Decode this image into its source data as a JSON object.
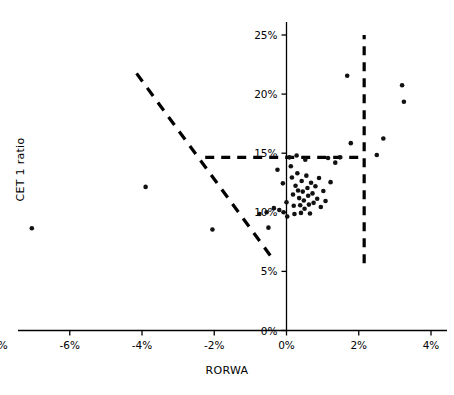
{
  "chart_data": {
    "type": "scatter",
    "title": "",
    "xlabel": "RORWA",
    "ylabel": "CET 1 ratio",
    "xlim": [
      -0.09,
      0.045
    ],
    "ylim": [
      0.0,
      0.26
    ],
    "xticks": [
      "-8%",
      "-6%",
      "-4%",
      "-2%",
      "0%",
      "2%",
      "4%"
    ],
    "xtick_values": [
      -0.08,
      -0.06,
      -0.04,
      -0.02,
      0.0,
      0.02,
      0.04
    ],
    "yticks": [
      "0%",
      "5%",
      "10%",
      "15%",
      "20%",
      "25%"
    ],
    "ytick_values": [
      0.0,
      0.05,
      0.1,
      0.15,
      0.2,
      0.25
    ],
    "grid": false,
    "legend": "none",
    "point_color": "#111111",
    "point_size": 4,
    "annotations": [
      {
        "name": "vertical-threshold-line",
        "type": "dashed-line",
        "orientation": "vertical",
        "x": 0.0215,
        "y_from": 0.057,
        "y_to": 0.25,
        "color": "#000000"
      },
      {
        "name": "horizontal-threshold-line",
        "type": "dashed-line",
        "orientation": "horizontal",
        "y": 0.1465,
        "x_from": -0.0225,
        "x_to": 0.0215,
        "color": "#000000"
      },
      {
        "name": "diagonal-frontier-line",
        "type": "dashed-line",
        "orientation": "diagonal",
        "x_from": -0.0415,
        "y_from": 0.2175,
        "x_to": -0.0045,
        "y_to": 0.0635,
        "color": "#000000"
      }
    ],
    "points": [
      {
        "x": -0.0705,
        "y": 0.0865
      },
      {
        "x": -0.039,
        "y": 0.1215
      },
      {
        "x": -0.0205,
        "y": 0.0855
      },
      {
        "x": -0.0075,
        "y": 0.0985
      },
      {
        "x": -0.0055,
        "y": 0.1
      },
      {
        "x": -0.005,
        "y": 0.087
      },
      {
        "x": -0.0035,
        "y": 0.1035
      },
      {
        "x": -0.0025,
        "y": 0.136
      },
      {
        "x": -0.002,
        "y": 0.102
      },
      {
        "x": -0.001,
        "y": 0.1245
      },
      {
        "x": -0.0008,
        "y": 0.1
      },
      {
        "x": 0.0,
        "y": 0.1085
      },
      {
        "x": 0.0002,
        "y": 0.0965
      },
      {
        "x": 0.0008,
        "y": 0.1465
      },
      {
        "x": 0.0012,
        "y": 0.139
      },
      {
        "x": 0.0015,
        "y": 0.1295
      },
      {
        "x": 0.0018,
        "y": 0.115
      },
      {
        "x": 0.002,
        "y": 0.1055
      },
      {
        "x": 0.0022,
        "y": 0.0985
      },
      {
        "x": 0.0025,
        "y": 0.1225
      },
      {
        "x": 0.0028,
        "y": 0.148
      },
      {
        "x": 0.003,
        "y": 0.133
      },
      {
        "x": 0.0032,
        "y": 0.1185
      },
      {
        "x": 0.0035,
        "y": 0.112
      },
      {
        "x": 0.0038,
        "y": 0.106
      },
      {
        "x": 0.004,
        "y": 0.0995
      },
      {
        "x": 0.0042,
        "y": 0.1265
      },
      {
        "x": 0.0045,
        "y": 0.1175
      },
      {
        "x": 0.0048,
        "y": 0.11
      },
      {
        "x": 0.005,
        "y": 0.103
      },
      {
        "x": 0.0052,
        "y": 0.1445
      },
      {
        "x": 0.0055,
        "y": 0.131
      },
      {
        "x": 0.0058,
        "y": 0.1205
      },
      {
        "x": 0.006,
        "y": 0.114
      },
      {
        "x": 0.0062,
        "y": 0.1065
      },
      {
        "x": 0.0065,
        "y": 0.099
      },
      {
        "x": 0.0068,
        "y": 0.125
      },
      {
        "x": 0.0072,
        "y": 0.116
      },
      {
        "x": 0.0075,
        "y": 0.108
      },
      {
        "x": 0.008,
        "y": 0.122
      },
      {
        "x": 0.0085,
        "y": 0.1115
      },
      {
        "x": 0.009,
        "y": 0.129
      },
      {
        "x": 0.0095,
        "y": 0.1045
      },
      {
        "x": 0.0102,
        "y": 0.118
      },
      {
        "x": 0.0108,
        "y": 0.1095
      },
      {
        "x": 0.0115,
        "y": 0.146
      },
      {
        "x": 0.0122,
        "y": 0.1255
      },
      {
        "x": 0.0135,
        "y": 0.142
      },
      {
        "x": 0.0148,
        "y": 0.1465
      },
      {
        "x": 0.0168,
        "y": 0.2155
      },
      {
        "x": 0.0178,
        "y": 0.1585
      },
      {
        "x": 0.025,
        "y": 0.1485
      },
      {
        "x": 0.0268,
        "y": 0.1625
      },
      {
        "x": 0.032,
        "y": 0.2075
      },
      {
        "x": 0.0325,
        "y": 0.1935
      }
    ]
  }
}
